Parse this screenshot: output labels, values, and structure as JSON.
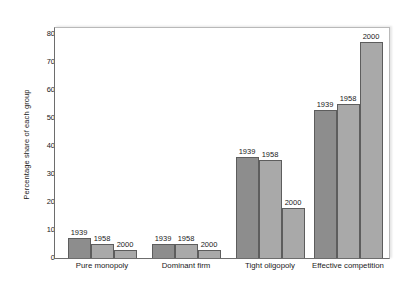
{
  "chart_data": {
    "type": "bar",
    "title": "",
    "xlabel": "",
    "ylabel": "Percentage share of each group",
    "ylim": [
      0,
      80
    ],
    "yticks": [
      0,
      10,
      20,
      30,
      40,
      50,
      60,
      70,
      80
    ],
    "grid": false,
    "legend_position": "none",
    "categories": [
      "Pure monopoly",
      "Dominant firm",
      "Tight oligopoly",
      "Effective competition"
    ],
    "series": [
      {
        "name": "1939",
        "values": [
          7,
          5,
          36,
          53
        ],
        "color": "#8d8d8d"
      },
      {
        "name": "1958",
        "values": [
          5,
          5,
          35,
          55
        ],
        "color": "#a9a9a9"
      },
      {
        "name": "2000",
        "values": [
          3,
          3,
          18,
          77
        ],
        "color": "#a9a9a9"
      }
    ],
    "bar_labels": [
      [
        "1939",
        "1958",
        "2000"
      ],
      [
        "1939",
        "1958",
        "2000"
      ],
      [
        "1939",
        "1958",
        "2000"
      ],
      [
        "1939",
        "1958",
        "2000"
      ]
    ]
  }
}
